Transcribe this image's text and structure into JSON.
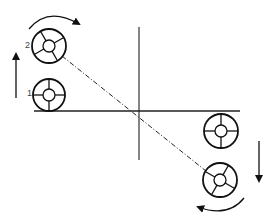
{
  "diagram": {
    "labels": {
      "wheel_2": "2",
      "wheel_1": "1"
    },
    "colors": {
      "stroke": "#111111",
      "axis": "#222222"
    },
    "elements": [
      "wheel-2-rotating-top-left",
      "wheel-1-static-left",
      "wheel-right-upper",
      "wheel-right-lower-rotating",
      "dashed-diagonal-line",
      "vertical-axis",
      "horizontal-axis",
      "up-arrow-left",
      "down-arrow-right",
      "clockwise-curved-arrow-top",
      "counterclockwise-curved-arrow-bottom"
    ]
  }
}
